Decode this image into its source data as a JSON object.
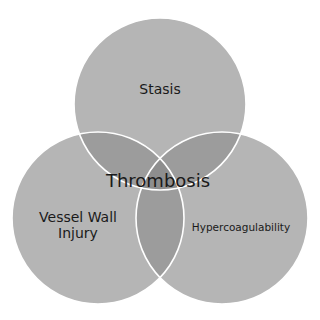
{
  "diagram": {
    "type": "venn",
    "center_label": "Thrombosis",
    "circles": [
      {
        "label": "Stasis",
        "cx": 160,
        "cy": 104,
        "r": 86
      },
      {
        "label_line1": "Vessel Wall",
        "label_line2": "Injury",
        "cx": 98,
        "cy": 218,
        "r": 86
      },
      {
        "label": "Hypercoagulability",
        "cx": 222,
        "cy": 218,
        "r": 86
      }
    ],
    "colors": {
      "fill": "#b4b4b4",
      "overlap": "#9a9a9a",
      "stroke": "#ffffff",
      "text": "#1a1a1a"
    }
  }
}
